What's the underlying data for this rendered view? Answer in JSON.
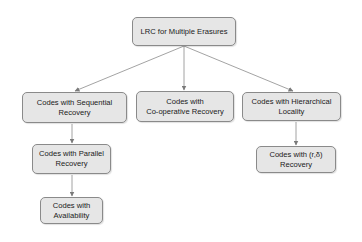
{
  "diagram": {
    "nodes": {
      "root": {
        "label": "LRC for Multiple Erasures"
      },
      "sequential": {
        "label": "Codes with Sequential\nRecovery"
      },
      "cooperative": {
        "label": "Codes with\nCo-operative Recovery"
      },
      "hierarchical": {
        "label": "Codes with Hierarchical\nLocality"
      },
      "parallel": {
        "label": "Codes with Parallel\nRecovery"
      },
      "availability": {
        "label": "Codes with\nAvailability"
      },
      "r_delta": {
        "label": "Codes with (r,δ)\nRecovery"
      }
    },
    "edges": [
      {
        "from": "root",
        "to": "sequential"
      },
      {
        "from": "root",
        "to": "cooperative"
      },
      {
        "from": "root",
        "to": "hierarchical"
      },
      {
        "from": "sequential",
        "to": "parallel"
      },
      {
        "from": "parallel",
        "to": "availability"
      },
      {
        "from": "hierarchical",
        "to": "r_delta"
      }
    ],
    "colors": {
      "node_fill": "#e6e6e6",
      "node_border": "#8a8a8a",
      "edge": "#8c8c8c"
    }
  }
}
